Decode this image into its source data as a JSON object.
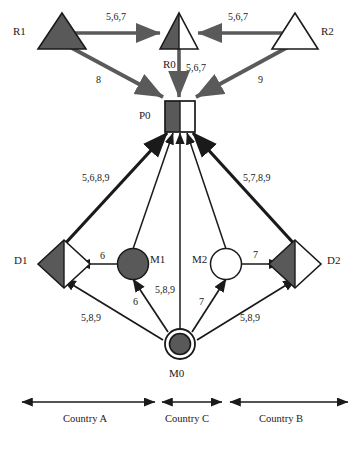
{
  "diagram": {
    "type": "network-flow-diagram",
    "colors": {
      "fill_dark": "#595959",
      "fill_light": "#ffffff",
      "stroke": "#1a1a1a",
      "arrow_gray": "#5a5a5a",
      "text": "#1a1a1a",
      "background": "#ffffff"
    },
    "nodes": [
      {
        "id": "R1",
        "label": "R1",
        "shape": "triangle",
        "fill": "dark",
        "label_x": 13,
        "label_y": 26
      },
      {
        "id": "R0",
        "label": "R0",
        "shape": "triangle",
        "fill": "split",
        "label_x": 163,
        "label_y": 59
      },
      {
        "id": "R2",
        "label": "R2",
        "shape": "triangle",
        "fill": "light",
        "label_x": 321,
        "label_y": 26
      },
      {
        "id": "P0",
        "label": "P0",
        "shape": "square",
        "fill": "split",
        "label_x": 139,
        "label_y": 110
      },
      {
        "id": "D1",
        "label": "D1",
        "shape": "diamond",
        "fill": "split",
        "label_x": 14,
        "label_y": 255
      },
      {
        "id": "M1",
        "label": "M1",
        "shape": "circle",
        "fill": "dark",
        "label_x": 150,
        "label_y": 254
      },
      {
        "id": "M2",
        "label": "M2",
        "shape": "circle",
        "fill": "light",
        "label_x": 192,
        "label_y": 254
      },
      {
        "id": "D2",
        "label": "D2",
        "shape": "diamond",
        "fill": "split",
        "label_x": 327,
        "label_y": 255
      },
      {
        "id": "M0",
        "label": "M0",
        "shape": "double-circle",
        "fill": "dark",
        "label_x": 169,
        "label_y": 368
      }
    ],
    "edge_labels": [
      {
        "id": "r1-r0",
        "text": "5,6,7",
        "x": 106,
        "y": 12
      },
      {
        "id": "r2-r0",
        "text": "5,6,7",
        "x": 228,
        "y": 12
      },
      {
        "id": "r1-p0",
        "text": "8",
        "x": 96,
        "y": 75
      },
      {
        "id": "r0-p0",
        "text": "5,6,7",
        "x": 186,
        "y": 63
      },
      {
        "id": "r2-p0",
        "text": "9",
        "x": 258,
        "y": 75
      },
      {
        "id": "d1-p0",
        "text": "5,6,8,9",
        "x": 82,
        "y": 173
      },
      {
        "id": "d2-p0",
        "text": "5,7,8,9",
        "x": 243,
        "y": 173
      },
      {
        "id": "m1-d1",
        "text": "6",
        "x": 100,
        "y": 251
      },
      {
        "id": "m2-d2",
        "text": "7",
        "x": 253,
        "y": 250
      },
      {
        "id": "m0-m1",
        "text": "6",
        "x": 133,
        "y": 297
      },
      {
        "id": "m0-p0",
        "text": "5,8,9",
        "x": 155,
        "y": 285
      },
      {
        "id": "m0-m2",
        "text": "7",
        "x": 199,
        "y": 297
      },
      {
        "id": "m0-d1",
        "text": "5,8,9",
        "x": 81,
        "y": 313
      },
      {
        "id": "m0-d2",
        "text": "5,8,9",
        "x": 240,
        "y": 313
      }
    ],
    "legend": {
      "items": [
        {
          "id": "country-a",
          "label": "Country A",
          "x1": 22,
          "x2": 155,
          "y": 402,
          "label_x": 63,
          "label_y": 414
        },
        {
          "id": "country-c",
          "label": "Country C",
          "x1": 162,
          "x2": 222,
          "y": 402,
          "label_x": 165,
          "label_y": 414
        },
        {
          "id": "country-b",
          "label": "Country B",
          "x1": 230,
          "x2": 348,
          "y": 402,
          "label_x": 259,
          "label_y": 414
        }
      ]
    }
  }
}
